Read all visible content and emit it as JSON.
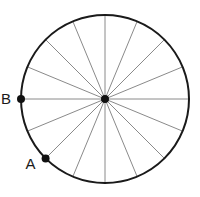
{
  "diagram": {
    "title": "",
    "spoke_count": 16,
    "points": [
      {
        "label": "B",
        "angle_deg": 180
      },
      {
        "label": "A",
        "angle_deg": 225
      }
    ],
    "colors": {
      "circle": "#1a1a1a",
      "spokes": "#8a8a8a",
      "points": "#111111"
    }
  }
}
